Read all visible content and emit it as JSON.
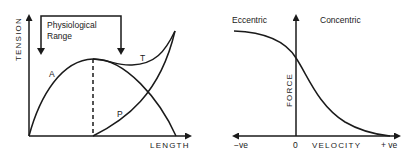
{
  "left_diagram": {
    "y_axis_label": "TENSION",
    "x_axis_label": "LENGTH",
    "bracket_label_line1": "Physiological",
    "bracket_label_line2": "Range",
    "curve_labels": {
      "active": "A",
      "total": "T",
      "passive": "P"
    }
  },
  "right_diagram": {
    "y_axis_label": "FORCE",
    "x_axis_label": "VELOCITY",
    "left_region_label": "Eccentric",
    "right_region_label": "Concentric",
    "x_tick_negative": "−ve",
    "x_tick_zero": "0",
    "x_tick_positive": "+ ve"
  },
  "colors": {
    "ink": "#1a1a1a",
    "background": "#ffffff"
  }
}
